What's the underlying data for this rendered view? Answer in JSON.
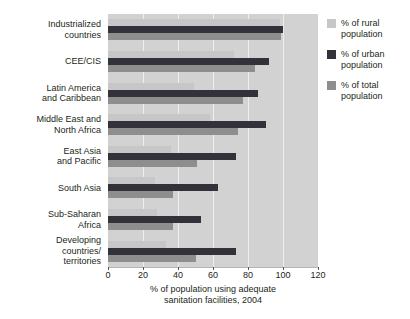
{
  "chart_data": {
    "type": "bar",
    "orientation": "horizontal",
    "title": "",
    "xlabel_lines": [
      "% of population using adequate",
      "sanitation facilities, 2004"
    ],
    "xlim": [
      0,
      120
    ],
    "x_ticks": [
      0,
      20,
      40,
      60,
      80,
      100,
      120
    ],
    "grid": "vertical",
    "legend_position": "top-right",
    "categories": [
      "Industrialized countries",
      "CEE/CIS",
      "Latin America and Caribbean",
      "Middle East and North Africa",
      "East Asia and Pacific",
      "South Asia",
      "Sub-Saharan Africa",
      "Developing countries/territories"
    ],
    "category_label_lines": [
      "Industrialized\ncountries",
      "CEE/CIS",
      "Latin America\nand Caribbean",
      "Middle East and\nNorth Africa",
      "East Asia\nand Pacific",
      "South Asia",
      "Sub-Saharan\nAfrica",
      "Developing\ncountries/\nterritories"
    ],
    "series": [
      {
        "key": "rural",
        "name": "% of rural population",
        "color": "#c7c7c7",
        "values": [
          98,
          72,
          49,
          58,
          36,
          27,
          28,
          33
        ]
      },
      {
        "key": "urban",
        "name": "% of urban population",
        "color": "#32323a",
        "values": [
          100,
          92,
          86,
          90,
          73,
          63,
          53,
          73
        ]
      },
      {
        "key": "total",
        "name": "% of total population",
        "color": "#8e8e8e",
        "values": [
          99,
          84,
          77,
          74,
          51,
          37,
          37,
          50
        ]
      }
    ]
  },
  "colors": {
    "plot_background": "#d2d2d2",
    "gridline": "#eeeeee",
    "text": "#231f20",
    "rural_bar": "#c7c7c7",
    "urban_bar": "#32323a",
    "total_bar": "#8e8e8e"
  }
}
